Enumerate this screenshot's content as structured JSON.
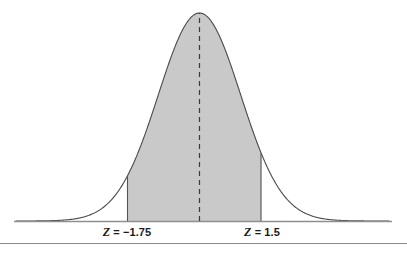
{
  "figure": {
    "background_color": "#ffffff",
    "bottom_rule_color": "#8a8a8a"
  },
  "labels": {
    "left": {
      "symbol": "Z",
      "equals": " = ",
      "value": "−1.75",
      "full_text": "Z = −1.75"
    },
    "right": {
      "symbol": "Z",
      "equals": " = ",
      "value": "1.5",
      "full_text": "Z = 1.5"
    }
  },
  "colors": {
    "curve_stroke": "#4a4a4a",
    "shade_fill": "#c9c9c9",
    "axis_stroke": "#8f8f8f",
    "boundary_stroke": "#555555",
    "center_dash": "#3a3a3a",
    "text": "#1a1a1a"
  },
  "chart_data": {
    "type": "area",
    "title": "",
    "subtitle": "",
    "xlabel": "",
    "ylabel": "",
    "distribution": "standard normal (Gaussian, mean 0, sd 1)",
    "xlim": [
      -4.45,
      4.6
    ],
    "ylim": [
      0,
      0.4
    ],
    "grid": false,
    "legend": null,
    "annotations": [
      {
        "text": "Z = −1.75",
        "x": -1.75,
        "y": 0,
        "position": "below-axis"
      },
      {
        "text": "Z = 1.5",
        "x": 1.5,
        "y": 0,
        "position": "below-axis"
      }
    ],
    "shaded_region": {
      "from": -1.75,
      "to": 1.5,
      "fill": "#c9c9c9",
      "description": "Area under the standard normal curve between Z = -1.75 and Z = 1.5"
    },
    "reference_lines": [
      {
        "type": "vertical-dashed",
        "x": 0,
        "label": "mean",
        "from_y": 0,
        "to_y": 0.3989
      },
      {
        "type": "vertical-solid",
        "x": -1.75,
        "from_y": 0,
        "to_y": 0.0863
      },
      {
        "type": "vertical-solid",
        "x": 1.5,
        "from_y": 0,
        "to_y": 0.1295
      }
    ],
    "x": [
      -4.45,
      -4.0,
      -3.5,
      -3.0,
      -2.5,
      -2.0,
      -1.75,
      -1.5,
      -1.0,
      -0.5,
      0.0,
      0.5,
      1.0,
      1.5,
      2.0,
      2.5,
      3.0,
      3.5,
      4.0,
      4.6
    ],
    "values": [
      0.0,
      0.0001,
      0.0009,
      0.0044,
      0.0175,
      0.054,
      0.0863,
      0.1295,
      0.242,
      0.3521,
      0.3989,
      0.3521,
      0.242,
      0.1295,
      0.054,
      0.0175,
      0.0044,
      0.0009,
      0.0001,
      0.0
    ],
    "series": [
      {
        "name": "standard normal density",
        "values": [
          0.0,
          0.0001,
          0.0009,
          0.0044,
          0.0175,
          0.054,
          0.0863,
          0.1295,
          0.242,
          0.3521,
          0.3989,
          0.3521,
          0.242,
          0.1295,
          0.054,
          0.0175,
          0.0044,
          0.0009,
          0.0001,
          0.0
        ]
      }
    ]
  },
  "geometry": {
    "axis_y": 221,
    "peak_y": 13,
    "center_x": 199.5,
    "px_per_z": 41.2,
    "left_boundary_x": 127,
    "right_boundary_x": 261,
    "axis_x_start": 14,
    "axis_x_end": 392
  }
}
